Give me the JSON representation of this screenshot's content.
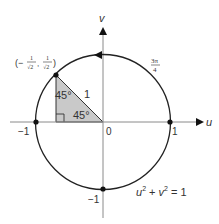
{
  "diagram": {
    "axes": {
      "horizontal_label": "u",
      "vertical_label": "v",
      "origin_label": "0"
    },
    "tick_labels": {
      "neg_one_x": "−1",
      "pos_one_x": "1",
      "neg_one_y": "−1"
    },
    "point": {
      "label_open": "(−",
      "num1": "1",
      "den1": "√2",
      "comma": ",",
      "num2": "1",
      "den2": "√2",
      "label_close": ")"
    },
    "triangle": {
      "top_angle": "45°",
      "bottom_angle": "45°",
      "hypotenuse": "1",
      "fill": "#c8c8c8"
    },
    "angle_label": {
      "num": "3π",
      "den": "4"
    },
    "equation": {
      "u": "u",
      "exp1": "2",
      "plus": " + ",
      "v": "v",
      "exp2": "2",
      "eq": " = 1"
    },
    "colors": {
      "stroke": "#222222",
      "axis": "#888888",
      "text": "#333333"
    }
  }
}
